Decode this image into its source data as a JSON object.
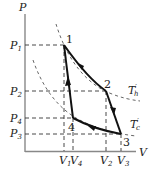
{
  "diagram": {
    "type": "P-V cycle diagram",
    "axes": {
      "y_label": "P",
      "x_label": "V",
      "p_ticks": [
        {
          "main": "P",
          "sub": "1"
        },
        {
          "main": "P",
          "sub": "2"
        },
        {
          "main": "P",
          "sub": "4"
        },
        {
          "main": "P",
          "sub": "3"
        }
      ],
      "v_ticks": [
        {
          "main": "V",
          "sub": "1"
        },
        {
          "main": "V",
          "sub": "4"
        },
        {
          "main": "V",
          "sub": "2"
        },
        {
          "main": "V",
          "sub": "3"
        }
      ]
    },
    "points": [
      {
        "label": "1"
      },
      {
        "label": "2"
      },
      {
        "label": "3"
      },
      {
        "label": "4"
      }
    ],
    "isotherms": [
      {
        "main": "T",
        "sub": "h",
        "prime": "′"
      },
      {
        "main": "T",
        "sub": "c",
        "prime": "′"
      }
    ],
    "colors": {
      "curve": "#111111",
      "axis": "#888888",
      "dashed": "#333333"
    }
  }
}
